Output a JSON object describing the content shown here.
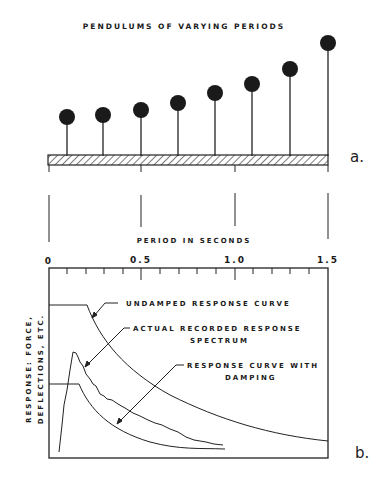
{
  "panel_a": {
    "title": "PENDULUMS OF VARYING PERIODS",
    "label": "a.",
    "pendulums": [
      {
        "x": 67,
        "top": 117
      },
      {
        "x": 103,
        "top": 115
      },
      {
        "x": 141,
        "top": 110
      },
      {
        "x": 178,
        "top": 103
      },
      {
        "x": 215,
        "top": 93
      },
      {
        "x": 252,
        "top": 84
      },
      {
        "x": 290,
        "top": 69
      },
      {
        "x": 328,
        "top": 43
      }
    ]
  },
  "panel_b": {
    "axis_title": "PERIOD IN SECONDS",
    "ticks": [
      "0",
      "0.5",
      "1.0",
      "1.5"
    ],
    "y_label_line1": "RESPONSE: FORCE,",
    "y_label_line2": "DEFLECTIONS, ETC.",
    "label": "b.",
    "annotations": {
      "undamped": "UNDAMPED RESPONSE CURVE",
      "actual_line1": "ACTUAL RECORDED RESPONSE",
      "actual_line2": "SPECTRUM",
      "damped_line1": "RESPONSE CURVE WITH",
      "damped_line2": "DAMPING"
    }
  }
}
